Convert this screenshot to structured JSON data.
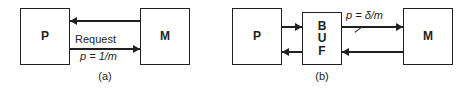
{
  "figure": {
    "width": 468,
    "height": 93,
    "background": "#ffffff",
    "ink_color": "#231f20"
  },
  "panels": [
    {
      "id": "a",
      "caption": "(a)",
      "nodes": [
        {
          "name": "process",
          "label": "P",
          "x": 20,
          "y": 8,
          "w": 50,
          "h": 57
        },
        {
          "name": "memory",
          "label": "M",
          "x": 140,
          "y": 8,
          "w": 50,
          "h": 57
        }
      ],
      "edges": [
        {
          "name": "memory-to-process",
          "from": "M",
          "to": "P",
          "direction": "left",
          "y": 20,
          "x1": 70,
          "x2": 140,
          "labels": []
        },
        {
          "name": "process-to-memory-request",
          "from": "P",
          "to": "M",
          "direction": "right",
          "y": 48,
          "x1": 70,
          "x2": 140,
          "labels": [
            {
              "name": "request-label",
              "text": "Request",
              "style": "upright",
              "position": "above"
            },
            {
              "name": "request-rate-label",
              "text": "p = 1/m",
              "style": "italic",
              "position": "below"
            }
          ]
        }
      ]
    },
    {
      "id": "b",
      "caption": "(b)",
      "nodes": [
        {
          "name": "process",
          "label": "P",
          "x": 232,
          "y": 8,
          "w": 50,
          "h": 57
        },
        {
          "name": "buffer",
          "label": "BUF",
          "x": 302,
          "y": 12,
          "w": 40,
          "h": 53,
          "label_lines": [
            "B",
            "U",
            "F"
          ]
        },
        {
          "name": "memory",
          "label": "M",
          "x": 403,
          "y": 8,
          "w": 50,
          "h": 57
        }
      ],
      "edges": [
        {
          "name": "process-to-buffer",
          "from": "P",
          "to": "BUF",
          "direction": "right",
          "y": 26,
          "x1": 282,
          "x2": 302,
          "labels": []
        },
        {
          "name": "buffer-to-process",
          "from": "BUF",
          "to": "P",
          "direction": "left",
          "y": 51,
          "x1": 282,
          "x2": 302,
          "labels": []
        },
        {
          "name": "buffer-to-memory",
          "from": "BUF",
          "to": "M",
          "direction": "right",
          "y": 26,
          "x1": 342,
          "x2": 403,
          "slash": true,
          "labels": [
            {
              "name": "buffer-rate-label",
              "text": "p = δ/m",
              "style": "italic",
              "position": "above"
            }
          ]
        },
        {
          "name": "memory-to-buffer",
          "from": "M",
          "to": "BUF",
          "direction": "left",
          "y": 51,
          "x1": 342,
          "x2": 403,
          "labels": []
        }
      ]
    }
  ]
}
